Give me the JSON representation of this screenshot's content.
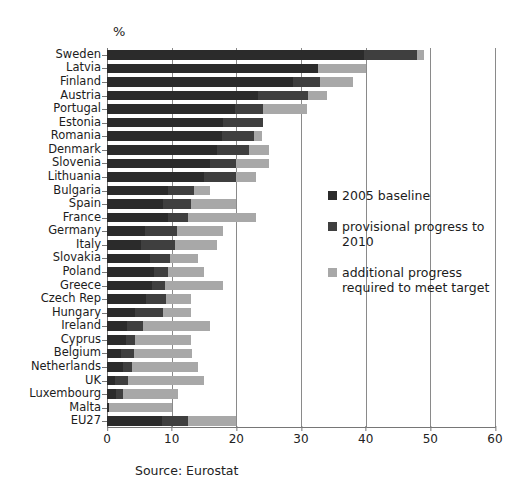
{
  "unit_label": "%",
  "source_note": "Source: Eurostat",
  "legend": {
    "position": "inside-right",
    "items": [
      {
        "label": "2005 baseline",
        "color": "#2b2b2b",
        "key": "baseline"
      },
      {
        "label": "provisional progress to 2010",
        "color": "#3f3f3f",
        "key": "provisional"
      },
      {
        "label": "additional progress required to meet target",
        "color": "#a8a8a8",
        "key": "additional"
      }
    ]
  },
  "chart_data": {
    "type": "bar",
    "orientation": "horizontal",
    "stacked": true,
    "title": "",
    "subtitle": "",
    "xlabel": "%",
    "ylabel": "",
    "xlim": [
      0,
      60
    ],
    "xticks": [
      0,
      10,
      20,
      30,
      40,
      50,
      60
    ],
    "grid": "vertical",
    "legend_position": "inside-right",
    "categories": [
      "Sweden",
      "Latvia",
      "Finland",
      "Austria",
      "Portugal",
      "Estonia",
      "Romania",
      "Denmark",
      "Slovenia",
      "Lithuania",
      "Bulgaria",
      "Spain",
      "France",
      "Germany",
      "Italy",
      "Slovakia",
      "Poland",
      "Greece",
      "Czech Rep",
      "Hungary",
      "Ireland",
      "Cyprus",
      "Belgium",
      "Netherlands",
      "UK",
      "Luxembourg",
      "Malta",
      "EU27"
    ],
    "series": [
      {
        "name": "2005 baseline",
        "color": "#2b2b2b",
        "values": [
          39.8,
          32.6,
          28.8,
          23.3,
          19.8,
          18.0,
          17.8,
          17.0,
          16.0,
          15.0,
          9.4,
          8.7,
          9.5,
          5.8,
          5.2,
          6.7,
          7.2,
          7.0,
          6.1,
          4.3,
          3.1,
          2.9,
          2.2,
          2.4,
          1.3,
          1.4,
          0.3,
          8.5
        ],
        "axis_units": "percent"
      },
      {
        "name": "provisional progress to 2010",
        "color": "#3f3f3f",
        "values": [
          8.2,
          0.0,
          4.1,
          7.8,
          4.4,
          6.2,
          5.0,
          5.0,
          3.9,
          5.0,
          4.1,
          4.3,
          3.0,
          5.1,
          5.3,
          3.0,
          2.3,
          2.0,
          3.1,
          4.4,
          2.5,
          1.5,
          2.0,
          1.4,
          2.0,
          1.1,
          0.0,
          4.0
        ],
        "axis_units": "percent"
      },
      {
        "name": "additional progress required to meet target",
        "color": "#a8a8a8",
        "values": [
          1.0,
          7.4,
          5.1,
          2.9,
          6.8,
          0.0,
          1.2,
          3.0,
          5.1,
          3.0,
          2.5,
          7.0,
          10.5,
          7.1,
          6.5,
          4.3,
          5.5,
          9.0,
          3.8,
          4.3,
          10.4,
          8.6,
          9.0,
          10.2,
          11.7,
          8.5,
          9.7,
          7.5
        ],
        "axis_units": "percent"
      }
    ],
    "totals_note": "Bars are stacked: baseline + provisional progress + additional progress = national target"
  }
}
